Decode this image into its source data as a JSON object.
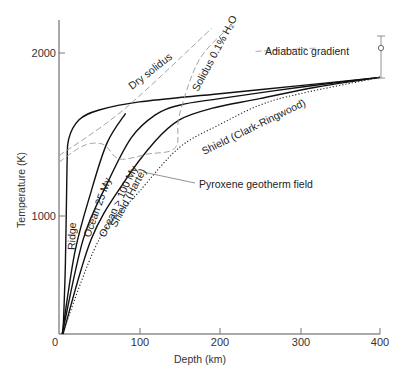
{
  "chart_data": {
    "type": "line",
    "title": "",
    "xlabel": "Depth (km)",
    "ylabel": "Temperature (K)",
    "xlim": [
      0,
      400
    ],
    "ylim": [
      0,
      2200
    ],
    "x_ticks": [
      0,
      100,
      200,
      300,
      400
    ],
    "y_ticks": [
      0,
      1000,
      2000
    ],
    "grid": false,
    "legend": "inline labels",
    "series": [
      {
        "name": "Ridge",
        "style": "solid",
        "points": [
          [
            5,
            0
          ],
          [
            8,
            600
          ],
          [
            10,
            1300
          ],
          [
            12,
            1470
          ],
          [
            25,
            1590
          ],
          [
            50,
            1650
          ],
          [
            100,
            1700
          ],
          [
            200,
            1750
          ],
          [
            300,
            1800
          ],
          [
            400,
            1850
          ]
        ]
      },
      {
        "name": "Ocean 25 My",
        "style": "solid",
        "points": [
          [
            4,
            0
          ],
          [
            20,
            700
          ],
          [
            40,
            1150
          ],
          [
            60,
            1450
          ],
          [
            83,
            1630
          ]
        ]
      },
      {
        "name": "Ocean > 100 My",
        "style": "solid",
        "points": [
          [
            4,
            0
          ],
          [
            30,
            800
          ],
          [
            60,
            1200
          ],
          [
            90,
            1480
          ],
          [
            120,
            1620
          ],
          [
            150,
            1680
          ],
          [
            200,
            1720
          ],
          [
            300,
            1790
          ],
          [
            400,
            1850
          ]
        ]
      },
      {
        "name": "Shield (Harte)",
        "style": "solid",
        "points": [
          [
            5,
            0
          ],
          [
            40,
            800
          ],
          [
            80,
            1200
          ],
          [
            120,
            1460
          ],
          [
            150,
            1590
          ],
          [
            190,
            1660
          ],
          [
            250,
            1720
          ],
          [
            320,
            1790
          ],
          [
            400,
            1850
          ]
        ]
      },
      {
        "name": "Shield (Clark-Ringwood)",
        "style": "dotted",
        "points": [
          [
            4,
            0
          ],
          [
            50,
            800
          ],
          [
            100,
            1150
          ],
          [
            150,
            1420
          ],
          [
            200,
            1560
          ],
          [
            250,
            1680
          ],
          [
            300,
            1750
          ],
          [
            400,
            1850
          ]
        ]
      },
      {
        "name": "Dry solidus",
        "style": "dashed",
        "points": [
          [
            0,
            1370
          ],
          [
            80,
            1650
          ],
          [
            190,
            2150
          ]
        ]
      },
      {
        "name": "Solidus 0.1% H2O",
        "style": "dashed",
        "points": [
          [
            0,
            1330
          ],
          [
            30,
            1430
          ],
          [
            55,
            1440
          ],
          [
            75,
            1350
          ],
          [
            110,
            1380
          ],
          [
            145,
            1420
          ],
          [
            150,
            1620
          ],
          [
            175,
            1960
          ],
          [
            215,
            2170
          ]
        ]
      },
      {
        "name": "Adiabatic gradient",
        "style": "dashed",
        "points": [
          [
            245,
            2010
          ],
          [
            320,
            2030
          ]
        ]
      }
    ],
    "annotations": [
      {
        "text": "Pyroxene geotherm field",
        "at": [
          170,
          1230
        ]
      },
      {
        "text": "Adiabatic gradient",
        "at": [
          245,
          2030
        ]
      }
    ],
    "end_point": {
      "depth": 400,
      "temperature": 1850,
      "error_range": [
        1700,
        1980
      ]
    }
  },
  "labels": {
    "ridge": "Ridge",
    "ocean25": "Ocean 25 My",
    "ocean100": "Ocean > 100 My",
    "shield_harte": "Shield (Harte)",
    "shield_cr": "Shield (Clark-Ringwood)",
    "dry_solidus": "Dry solidus",
    "wet_solidus": "Solidus 0.1% H₂O",
    "adiabatic": "Adiabatic gradient",
    "pyroxene": "Pyroxene geotherm field",
    "xlabel": "Depth (km)",
    "ylabel": "Temperature (K)",
    "xticks": [
      "0",
      "100",
      "200",
      "300",
      "400"
    ],
    "yticks": [
      "1000",
      "2000"
    ]
  }
}
